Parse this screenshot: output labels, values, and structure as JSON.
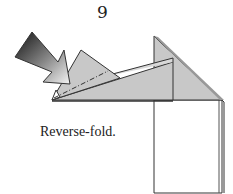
{
  "diagram": {
    "step_number": "9",
    "caption": "Reverse-fold.",
    "colors": {
      "paper_fill": "#c8c8c8",
      "paper_back": "#ffffff",
      "outline": "#333333",
      "arrow_dark": "#111111",
      "arrow_light": "#f2f2f2"
    },
    "elements": [
      {
        "type": "arrow",
        "name": "push-arrow",
        "direction": "down-right"
      },
      {
        "type": "fold-line",
        "style": "dash-dot",
        "meaning": "valley/mountain fold"
      },
      {
        "type": "flap",
        "name": "small-triangle-flap"
      },
      {
        "type": "flap",
        "name": "long-flap"
      },
      {
        "type": "flap",
        "name": "tall-triangle"
      },
      {
        "type": "panel",
        "name": "rectangle-body"
      }
    ]
  }
}
